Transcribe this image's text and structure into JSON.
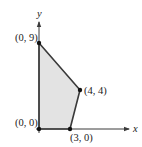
{
  "diagram": {
    "type": "feasible-region-polygon",
    "axes": {
      "x_label": "x",
      "y_label": "y"
    },
    "vertices": [
      {
        "label": "(0, 0)",
        "x": 0,
        "y": 0
      },
      {
        "label": "(0, 9)",
        "x": 0,
        "y": 9
      },
      {
        "label": "(4, 4)",
        "x": 4,
        "y": 4
      },
      {
        "label": "(3, 0)",
        "x": 3,
        "y": 0
      }
    ],
    "colors": {
      "fill": "#e3e3e3",
      "edge": "#3a3a3a",
      "axis": "#3a3a3a",
      "point": "#111111"
    }
  }
}
